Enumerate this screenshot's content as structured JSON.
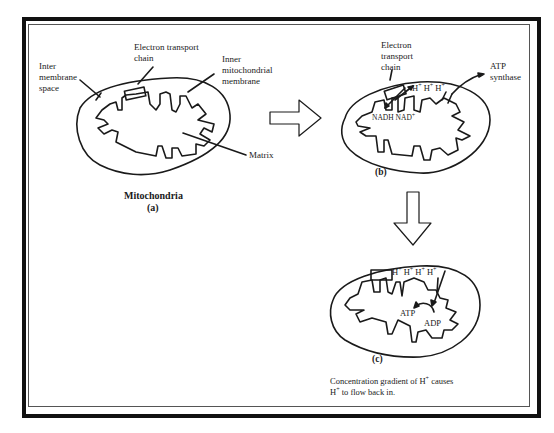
{
  "panel_a": {
    "labels": {
      "inter_membrane_space": "Inter\nmembrane\nspace",
      "electron_transport_chain": "Electron transport\nchain",
      "inner_mitochondrial_membrane": "Inner\nmitochondrial\nmembrane",
      "matrix": "Matrix"
    },
    "title": "Mitochondria",
    "caption": "(a)"
  },
  "panel_b": {
    "labels": {
      "electron_transport_chain": "Electron\ntransport\nchain",
      "atp_synthase": "ATP\nsynthase",
      "protons": [
        "H",
        "H",
        "H"
      ],
      "proton_charge": "+",
      "nadh": "NADH",
      "nad": "NAD",
      "nad_charge": "+"
    },
    "caption": "(b)"
  },
  "panel_c": {
    "labels": {
      "protons": [
        "H",
        "H",
        "H",
        "H"
      ],
      "proton_charge": "+",
      "atp": "ATP",
      "adp": "ADP"
    },
    "caption": "(c)",
    "description_line1_pre": "Concentration gradient of H",
    "description_line1_post": " causes",
    "description_line2_pre": "H",
    "description_line2_post": " to flow back in.",
    "charge": "+"
  },
  "arrows": [
    "right-arrow-a-to-b",
    "down-arrow-b-to-c"
  ]
}
